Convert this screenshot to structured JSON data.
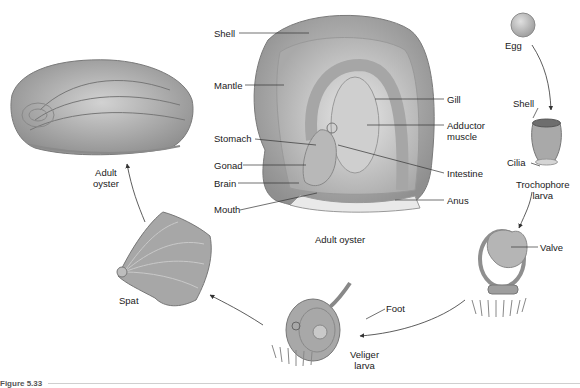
{
  "diagram": {
    "caption": "Figure 5.33",
    "stages": [
      {
        "id": "adult",
        "label_line1": "Adult",
        "label_line2": "oyster"
      },
      {
        "id": "egg",
        "label": "Egg"
      },
      {
        "id": "trochophore",
        "label_line1": "Trochophore",
        "label_line2": "larva"
      },
      {
        "id": "veliger",
        "label_line1": "Veliger",
        "label_line2": "larva"
      },
      {
        "id": "spat",
        "label": "Spat"
      }
    ],
    "anatomy": {
      "caption": "Adult oyster",
      "left_labels": [
        "Shell",
        "Mantle",
        "Stomach",
        "Gonad",
        "Brain",
        "Mouth"
      ],
      "right_labels": [
        "Gill",
        "Adductor",
        "muscle",
        "Intestine",
        "Anus"
      ]
    },
    "larva_parts": {
      "trochophore_shell": "Shell",
      "trochophore_cilia": "Cilia",
      "valve": "Valve",
      "foot": "Foot"
    }
  }
}
